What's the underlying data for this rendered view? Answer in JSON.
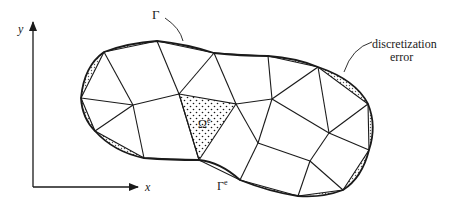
{
  "diagram": {
    "type": "finite-element-discretization",
    "colors": {
      "ink": "#1a1a1a",
      "background": "#ffffff",
      "hatch": "#9a9a9a"
    },
    "axes": {
      "x_label": "x",
      "y_label": "y"
    },
    "labels": {
      "boundary": "Γ",
      "element_boundary": "Γ",
      "element_boundary_sup": "e",
      "element_domain": "Ω",
      "element_domain_sup": "e",
      "discretization_error_line1": "discretization",
      "discretization_error_line2": "error"
    }
  }
}
